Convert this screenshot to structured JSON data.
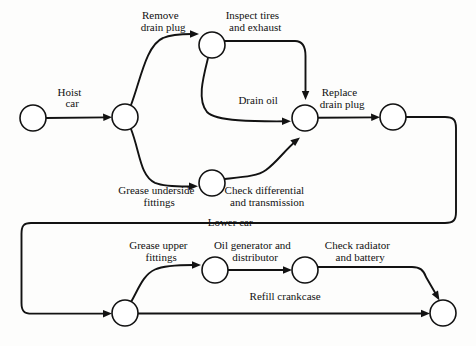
{
  "diagram": {
    "type": "activity-on-arc network",
    "background_color": "#fdfdfc",
    "line_color": "#121212",
    "node_fill": "#ffffff",
    "nodes": [
      {
        "id": "n1",
        "cx": 33,
        "cy": 118,
        "r": 13
      },
      {
        "id": "n2",
        "cx": 125,
        "cy": 117,
        "r": 13
      },
      {
        "id": "n3",
        "cx": 212,
        "cy": 45,
        "r": 13
      },
      {
        "id": "n4",
        "cx": 305,
        "cy": 118,
        "r": 13
      },
      {
        "id": "n5",
        "cx": 393,
        "cy": 117,
        "r": 13
      },
      {
        "id": "n6",
        "cx": 212,
        "cy": 183,
        "r": 13
      },
      {
        "id": "n7",
        "cx": 125,
        "cy": 313,
        "r": 13
      },
      {
        "id": "n8",
        "cx": 215,
        "cy": 270,
        "r": 13
      },
      {
        "id": "n9",
        "cx": 305,
        "cy": 270,
        "r": 13
      },
      {
        "id": "n10",
        "cx": 443,
        "cy": 313,
        "r": 13
      }
    ],
    "labels": {
      "hoist_car": {
        "lines": [
          "Hoist",
          "car"
        ],
        "x": 79,
        "y": 96
      },
      "remove_drain_plug": {
        "lines": [
          "Remove",
          "drain plug"
        ],
        "x": 170,
        "y": 19
      },
      "inspect_tires_and_exhaust": {
        "lines": [
          "Inspect tires",
          "and exhaust"
        ],
        "x": 262,
        "y": 19
      },
      "drain_oil": {
        "lines": [
          "Drain oil"
        ],
        "x": 265,
        "y": 104
      },
      "replace_drain_plug": {
        "lines": [
          "Replace",
          "drain plug"
        ],
        "x": 349,
        "y": 96
      },
      "grease_underside_fittings": {
        "lines": [
          "Grease underside",
          "fittings"
        ],
        "x": 166,
        "y": 194
      },
      "check_differential_and_transmission": {
        "lines": [
          "Check differential",
          "and transmission"
        ],
        "x": 272,
        "y": 194
      },
      "lower_car": {
        "lines": [
          "Lower car"
        ],
        "x": 237,
        "y": 226
      },
      "grease_upper_fittings": {
        "lines": [
          "Grease upper",
          "fittings"
        ],
        "x": 168,
        "y": 249
      },
      "oil_generator_and_distributor": {
        "lines": [
          "Oil generator and",
          "distributor"
        ],
        "x": 260,
        "y": 249
      },
      "check_radiator_and_battery": {
        "lines": [
          "Check radiator",
          "and battery"
        ],
        "x": 367,
        "y": 249
      },
      "refill_crankcase": {
        "lines": [
          "Refill crankcase"
        ],
        "x": 292,
        "y": 300
      }
    },
    "activities": [
      {
        "name": "hoist-car",
        "label": "Hoist car",
        "from": "n1",
        "to": "n2"
      },
      {
        "name": "remove-drain-plug",
        "label": "Remove drain plug",
        "from": "n2",
        "to": "n3"
      },
      {
        "name": "inspect-tires-and-exhaust",
        "label": "Inspect tires and exhaust",
        "from": "n3",
        "to": "n4"
      },
      {
        "name": "drain-oil",
        "label": "Drain oil",
        "from": "n3",
        "to": "n4"
      },
      {
        "name": "grease-underside-fittings",
        "label": "Grease underside fittings",
        "from": "n2",
        "to": "n6"
      },
      {
        "name": "check-differential-and-transmission",
        "label": "Check differential and transmission",
        "from": "n6",
        "to": "n4"
      },
      {
        "name": "replace-drain-plug",
        "label": "Replace drain plug",
        "from": "n4",
        "to": "n5"
      },
      {
        "name": "lower-car",
        "label": "Lower car",
        "from": "n5",
        "to": "n7"
      },
      {
        "name": "grease-upper-fittings",
        "label": "Grease upper fittings",
        "from": "n7",
        "to": "n8"
      },
      {
        "name": "oil-generator-and-distributor",
        "label": "Oil generator and distributor",
        "from": "n8",
        "to": "n9"
      },
      {
        "name": "check-radiator-and-battery",
        "label": "Check radiator and battery",
        "from": "n9",
        "to": "n10"
      },
      {
        "name": "refill-crankcase",
        "label": "Refill crankcase",
        "from": "n7",
        "to": "n10"
      }
    ]
  }
}
